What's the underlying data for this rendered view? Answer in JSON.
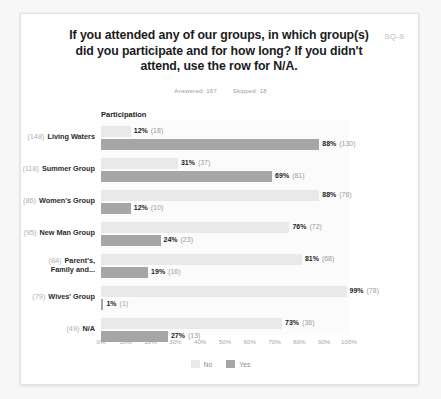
{
  "card": {
    "tag": "SQ-9",
    "title": "If you attended any of our groups, in which group(s) did you participate and for how long? If you didn't attend, use the row for N/A.",
    "answered_label": "Answered: 167",
    "skipped_label": "Skipped: 18",
    "participation_header": "Participation"
  },
  "colors": {
    "no": "#e9e9e9",
    "yes": "#a6a6a6",
    "text": "#1b1b1b",
    "muted": "#9b9b9b",
    "card_bg": "#ffffff",
    "page_bg": "#f7f7f7"
  },
  "chart_data": {
    "type": "bar",
    "title": "If you attended any of our groups, in which group(s) did you participate and for how long? If you didn't attend, use the row for N/A.",
    "xlabel": "",
    "ylabel": "",
    "xlim": [
      0,
      100
    ],
    "grid": false,
    "orientation": "horizontal",
    "legend_position": "bottom",
    "legend": [
      "No",
      "Yes"
    ],
    "tick_labels": [
      "0%",
      "10%",
      "20%",
      "30%",
      "40%",
      "50%",
      "60%",
      "70%",
      "80%",
      "90%",
      "100%"
    ],
    "tick_values": [
      0,
      10,
      20,
      30,
      40,
      50,
      60,
      70,
      80,
      90,
      100
    ],
    "categories": [
      "Living Waters",
      "Summer Group",
      "Women's Group",
      "New Man Group",
      "Parent's, Family and...",
      "Wives' Group",
      "N/A"
    ],
    "category_totals": [
      148,
      118,
      86,
      95,
      84,
      79,
      49
    ],
    "series": [
      {
        "name": "No",
        "values": [
          12,
          31,
          88,
          76,
          81,
          99,
          73
        ],
        "counts": [
          18,
          37,
          76,
          72,
          68,
          78,
          36
        ]
      },
      {
        "name": "Yes",
        "values": [
          88,
          69,
          12,
          24,
          19,
          1,
          27
        ],
        "counts": [
          130,
          81,
          10,
          23,
          16,
          1,
          13
        ]
      }
    ]
  },
  "rows": [
    {
      "count_label": "(148)",
      "name": "Living Waters",
      "multiline": false,
      "line1": "Living Waters",
      "line2": "",
      "no": {
        "pct": 12,
        "pct_label": "12%",
        "count_label": "(18)"
      },
      "yes": {
        "pct": 88,
        "pct_label": "88%",
        "count_label": "(130)"
      }
    },
    {
      "count_label": "(118)",
      "name": "Summer Group",
      "multiline": false,
      "line1": "Summer Group",
      "line2": "",
      "no": {
        "pct": 31,
        "pct_label": "31%",
        "count_label": "(37)"
      },
      "yes": {
        "pct": 69,
        "pct_label": "69%",
        "count_label": "(81)"
      }
    },
    {
      "count_label": "(86)",
      "name": "Women's Group",
      "multiline": false,
      "line1": "Women's Group",
      "line2": "",
      "no": {
        "pct": 88,
        "pct_label": "88%",
        "count_label": "(76)"
      },
      "yes": {
        "pct": 12,
        "pct_label": "12%",
        "count_label": "(10)"
      }
    },
    {
      "count_label": "(95)",
      "name": "New Man Group",
      "multiline": false,
      "line1": "New Man Group",
      "line2": "",
      "no": {
        "pct": 76,
        "pct_label": "76%",
        "count_label": "(72)"
      },
      "yes": {
        "pct": 24,
        "pct_label": "24%",
        "count_label": "(23)"
      }
    },
    {
      "count_label": "(84)",
      "name": "Parent's, Family and...",
      "multiline": true,
      "line1": "Parent's,",
      "line2": "Family and...",
      "no": {
        "pct": 81,
        "pct_label": "81%",
        "count_label": "(68)"
      },
      "yes": {
        "pct": 19,
        "pct_label": "19%",
        "count_label": "(16)"
      }
    },
    {
      "count_label": "(79)",
      "name": "Wives' Group",
      "multiline": false,
      "line1": "Wives' Group",
      "line2": "",
      "no": {
        "pct": 99,
        "pct_label": "99%",
        "count_label": "(78)"
      },
      "yes": {
        "pct": 1,
        "pct_label": "1%",
        "count_label": "(1)"
      }
    },
    {
      "count_label": "(49)",
      "name": "N/A",
      "multiline": false,
      "line1": "N/A",
      "line2": "",
      "no": {
        "pct": 73,
        "pct_label": "73%",
        "count_label": "(36)"
      },
      "yes": {
        "pct": 27,
        "pct_label": "27%",
        "count_label": "(13)"
      }
    }
  ],
  "legend": [
    {
      "label": "No",
      "key": "no"
    },
    {
      "label": "Yes",
      "key": "yes"
    }
  ]
}
